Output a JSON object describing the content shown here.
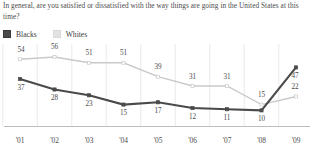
{
  "chart_data": {
    "type": "line",
    "title": "In general, are you satisfied or dissatisfied with the way things are going in the United States at this time?",
    "xlabel": "",
    "ylabel": "",
    "ylim": [
      0,
      62
    ],
    "grid": "vertical",
    "legend_position": "top-left",
    "categories": [
      "'01",
      "'02",
      "'03",
      "'04",
      "'05",
      "'06",
      "'07",
      "'08",
      "'09"
    ],
    "series": [
      {
        "name": "Blacks",
        "color": "#4a4a4a",
        "values": [
          37,
          28,
          23,
          15,
          17,
          12,
          11,
          10,
          47
        ]
      },
      {
        "name": "Whites",
        "color": "#c9c9c9",
        "values": [
          54,
          56,
          51,
          51,
          39,
          31,
          31,
          15,
          22
        ]
      }
    ]
  },
  "title": {
    "line1": "In general, are you satisfied or dissatisfied with the way things are going in the United States",
    "line2": "at this time?"
  },
  "legend": {
    "items": [
      {
        "label": "Blacks",
        "swatch": "dark-square-swatch"
      },
      {
        "label": "Whites",
        "swatch": "light-square-swatch"
      }
    ]
  },
  "axis": {
    "ticks": [
      "'01",
      "'02",
      "'03",
      "'04",
      "'05",
      "'06",
      "'07",
      "'08",
      "'09"
    ]
  },
  "labels": {
    "blacks": [
      "37",
      "28",
      "23",
      "15",
      "17",
      "12",
      "11",
      "10",
      "47"
    ],
    "whites": [
      "54",
      "56",
      "51",
      "51",
      "39",
      "31",
      "31",
      "15",
      "22"
    ]
  },
  "colors": {
    "blacks_line": "#4a4a4a",
    "whites_line": "#c9c9c9",
    "gridline": "#e6e6e6",
    "axis": "#b5b5b5",
    "text": "#4a4a4a"
  }
}
